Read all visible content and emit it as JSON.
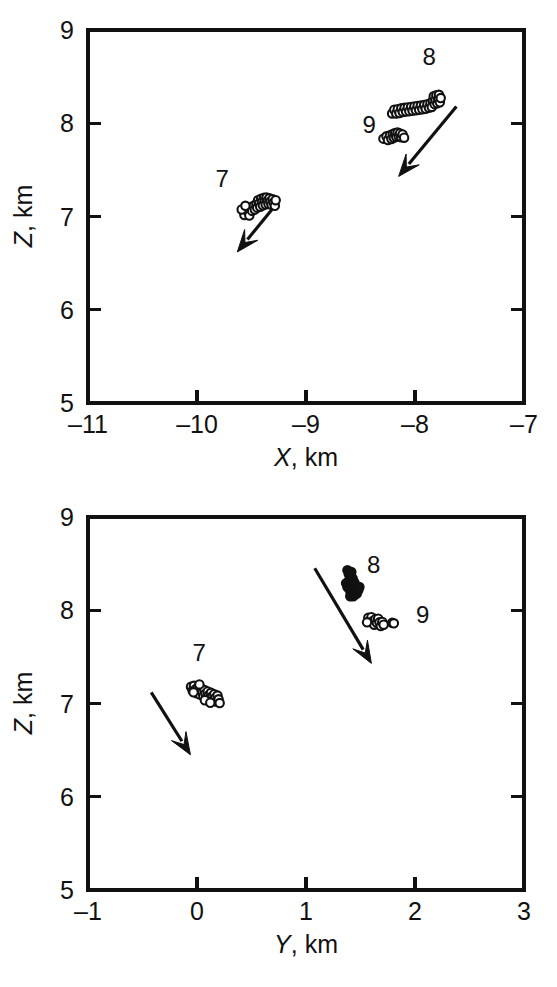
{
  "figure": {
    "background_color": "#ffffff",
    "ink_color": "#111111"
  },
  "chart_data": [
    {
      "type": "scatter",
      "panel": "top",
      "title": "",
      "xlabel": "X, km",
      "xlabel_symbol": "X",
      "xlabel_unit": ", km",
      "ylabel": "Z, km",
      "ylabel_symbol": "Z",
      "ylabel_unit": ", km",
      "xlim": [
        -11,
        -7
      ],
      "ylim": [
        5,
        9
      ],
      "xticks": [
        -11,
        -10,
        -9,
        -8,
        -7
      ],
      "xtick_labels": [
        "–11",
        "–10",
        "–9",
        "–8",
        "–7"
      ],
      "yticks": [
        5,
        6,
        7,
        8,
        9
      ],
      "ytick_labels": [
        "5",
        "6",
        "7",
        "8",
        "9"
      ],
      "grid": false,
      "legend": "none",
      "tick_direction": "in",
      "marker": "open-circle",
      "annotations": [
        {
          "label": "7",
          "x": -9.77,
          "y": 7.32
        },
        {
          "label": "8",
          "x": -7.87,
          "y": 8.62
        },
        {
          "label": "9",
          "x": -8.42,
          "y": 7.9
        }
      ],
      "arrows": [
        {
          "name": "arrow-cluster-7",
          "x1": -9.26,
          "y1": 7.15,
          "x2": -9.63,
          "y2": 6.62
        },
        {
          "name": "arrow-cluster-8-9",
          "x1": -7.62,
          "y1": 8.18,
          "x2": -8.15,
          "y2": 7.43
        }
      ],
      "series": [
        {
          "name": "cluster-7",
          "marker": "open-circle",
          "points": [
            [
              -9.575,
              7.055
            ],
            [
              -9.565,
              7.015
            ],
            [
              -9.545,
              7.09
            ],
            [
              -9.53,
              7.05
            ],
            [
              -9.52,
              7.01
            ],
            [
              -9.505,
              7.1
            ],
            [
              -9.495,
              7.06
            ],
            [
              -9.48,
              7.115
            ],
            [
              -9.47,
              7.075
            ],
            [
              -9.455,
              7.135
            ],
            [
              -9.448,
              7.095
            ],
            [
              -9.44,
              7.175
            ],
            [
              -9.43,
              7.14
            ],
            [
              -9.42,
              7.105
            ],
            [
              -9.412,
              7.19
            ],
            [
              -9.404,
              7.155
            ],
            [
              -9.396,
              7.12
            ],
            [
              -9.385,
              7.2
            ],
            [
              -9.378,
              7.165
            ],
            [
              -9.37,
              7.13
            ],
            [
              -9.362,
              7.205
            ],
            [
              -9.352,
              7.17
            ],
            [
              -9.344,
              7.135
            ],
            [
              -9.336,
              7.195
            ],
            [
              -9.326,
              7.16
            ],
            [
              -9.316,
              7.125
            ],
            [
              -9.306,
              7.185
            ],
            [
              -9.296,
              7.15
            ],
            [
              -9.286,
              7.115
            ],
            [
              -9.278,
              7.175
            ],
            [
              -9.59,
              7.075
            ],
            [
              -9.556,
              7.115
            ]
          ]
        },
        {
          "name": "cluster-8",
          "marker": "open-circle",
          "points": [
            [
              -8.21,
              8.105
            ],
            [
              -8.19,
              8.145
            ],
            [
              -8.172,
              8.105
            ],
            [
              -8.158,
              8.15
            ],
            [
              -8.142,
              8.11
            ],
            [
              -8.126,
              8.16
            ],
            [
              -8.112,
              8.12
            ],
            [
              -8.096,
              8.165
            ],
            [
              -8.082,
              8.125
            ],
            [
              -8.066,
              8.17
            ],
            [
              -8.052,
              8.13
            ],
            [
              -8.036,
              8.175
            ],
            [
              -8.022,
              8.135
            ],
            [
              -8.006,
              8.18
            ],
            [
              -7.992,
              8.14
            ],
            [
              -7.976,
              8.185
            ],
            [
              -7.962,
              8.145
            ],
            [
              -7.946,
              8.19
            ],
            [
              -7.932,
              8.15
            ],
            [
              -7.916,
              8.195
            ],
            [
              -7.902,
              8.155
            ],
            [
              -7.886,
              8.205
            ],
            [
              -7.872,
              8.165
            ],
            [
              -7.858,
              8.215
            ],
            [
              -7.846,
              8.175
            ],
            [
              -7.836,
              8.245
            ],
            [
              -7.828,
              8.29
            ],
            [
              -7.82,
              8.205
            ],
            [
              -7.812,
              8.25
            ],
            [
              -7.804,
              8.3
            ],
            [
              -7.796,
              8.215
            ],
            [
              -7.788,
              8.26
            ],
            [
              -7.78,
              8.305
            ],
            [
              -7.772,
              8.225
            ],
            [
              -7.764,
              8.27
            ]
          ]
        },
        {
          "name": "cluster-9",
          "marker": "open-circle",
          "points": [
            [
              -8.29,
              7.835
            ],
            [
              -8.262,
              7.86
            ],
            [
              -8.248,
              7.82
            ],
            [
              -8.23,
              7.87
            ],
            [
              -8.216,
              7.83
            ],
            [
              -8.204,
              7.885
            ],
            [
              -8.194,
              7.845
            ],
            [
              -8.182,
              7.895
            ],
            [
              -8.172,
              7.855
            ],
            [
              -8.16,
              7.9
            ],
            [
              -8.15,
              7.86
            ],
            [
              -8.138,
              7.89
            ],
            [
              -8.126,
              7.85
            ],
            [
              -8.114,
              7.88
            ],
            [
              -8.1,
              7.845
            ]
          ]
        }
      ]
    },
    {
      "type": "scatter",
      "panel": "bottom",
      "title": "",
      "xlabel": "Y, km",
      "xlabel_symbol": "Y",
      "xlabel_unit": ", km",
      "ylabel": "Z, km",
      "ylabel_symbol": "Z",
      "ylabel_unit": ", km",
      "xlim": [
        -1,
        3
      ],
      "ylim": [
        5,
        9
      ],
      "xticks": [
        -1,
        0,
        1,
        2,
        3
      ],
      "xtick_labels": [
        "–1",
        "0",
        "1",
        "2",
        "3"
      ],
      "yticks": [
        5,
        6,
        7,
        8,
        9
      ],
      "ytick_labels": [
        "5",
        "6",
        "7",
        "8",
        "9"
      ],
      "grid": false,
      "legend": "none",
      "tick_direction": "in",
      "marker": "open-circle",
      "annotations": [
        {
          "label": "7",
          "x": 0.02,
          "y": 7.46
        },
        {
          "label": "8",
          "x": 1.62,
          "y": 8.4
        },
        {
          "label": "9",
          "x": 2.07,
          "y": 7.86
        }
      ],
      "arrows": [
        {
          "name": "arrow-cluster-7",
          "x1": -0.42,
          "y1": 7.12,
          "x2": -0.06,
          "y2": 6.45
        },
        {
          "name": "arrow-cluster-8-9",
          "x1": 1.08,
          "y1": 8.45,
          "x2": 1.6,
          "y2": 7.43
        }
      ],
      "series": [
        {
          "name": "cluster-7",
          "marker": "open-circle",
          "points": [
            [
              -0.055,
              7.18
            ],
            [
              -0.04,
              7.14
            ],
            [
              -0.028,
              7.19
            ],
            [
              -0.015,
              7.15
            ],
            [
              -0.002,
              7.11
            ],
            [
              0.008,
              7.175
            ],
            [
              0.018,
              7.135
            ],
            [
              0.028,
              7.095
            ],
            [
              0.038,
              7.16
            ],
            [
              0.048,
              7.12
            ],
            [
              0.058,
              7.08
            ],
            [
              0.068,
              7.145
            ],
            [
              0.078,
              7.105
            ],
            [
              0.088,
              7.065
            ],
            [
              0.098,
              7.13
            ],
            [
              0.108,
              7.09
            ],
            [
              0.118,
              7.05
            ],
            [
              0.128,
              7.115
            ],
            [
              0.138,
              7.075
            ],
            [
              0.148,
              7.035
            ],
            [
              0.158,
              7.1
            ],
            [
              0.168,
              7.06
            ],
            [
              0.178,
              7.02
            ],
            [
              0.188,
              7.085
            ],
            [
              0.198,
              7.045
            ],
            [
              0.208,
              7.005
            ],
            [
              0.022,
              7.205
            ],
            [
              -0.032,
              7.12
            ],
            [
              0.072,
              7.035
            ],
            [
              0.122,
              7.008
            ]
          ]
        },
        {
          "name": "cluster-8",
          "marker": "solid-circle",
          "points": [
            [
              1.38,
              8.43
            ],
            [
              1.392,
              8.39
            ],
            [
              1.404,
              8.35
            ],
            [
              1.416,
              8.41
            ],
            [
              1.39,
              8.31
            ],
            [
              1.404,
              8.27
            ],
            [
              1.418,
              8.31
            ],
            [
              1.432,
              8.27
            ],
            [
              1.396,
              8.23
            ],
            [
              1.41,
              8.19
            ],
            [
              1.424,
              8.23
            ],
            [
              1.438,
              8.19
            ],
            [
              1.452,
              8.23
            ],
            [
              1.406,
              8.15
            ],
            [
              1.42,
              8.16
            ],
            [
              1.434,
              8.15
            ],
            [
              1.448,
              8.165
            ],
            [
              1.462,
              8.2
            ],
            [
              1.47,
              8.24
            ],
            [
              1.444,
              8.29
            ],
            [
              1.458,
              8.255
            ],
            [
              1.428,
              8.34
            ],
            [
              1.442,
              8.3
            ],
            [
              1.466,
              8.18
            ],
            [
              1.38,
              8.25
            ],
            [
              1.368,
              8.29
            ],
            [
              1.48,
              8.215
            ],
            [
              1.49,
              8.25
            ]
          ]
        },
        {
          "name": "cluster-9",
          "marker": "open-circle",
          "points": [
            [
              1.572,
              7.92
            ],
            [
              1.588,
              7.88
            ],
            [
              1.6,
              7.925
            ],
            [
              1.614,
              7.885
            ],
            [
              1.626,
              7.845
            ],
            [
              1.638,
              7.905
            ],
            [
              1.65,
              7.865
            ],
            [
              1.662,
              7.91
            ],
            [
              1.674,
              7.87
            ],
            [
              1.686,
              7.83
            ],
            [
              1.7,
              7.875
            ],
            [
              1.712,
              7.845
            ],
            [
              1.79,
              7.865
            ],
            [
              1.806,
              7.86
            ],
            [
              1.56,
              7.87
            ]
          ]
        }
      ]
    }
  ]
}
